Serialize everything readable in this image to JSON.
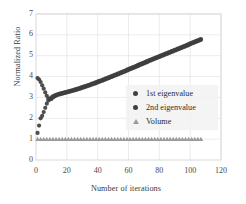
{
  "chart_data": {
    "type": "scatter",
    "title": "",
    "xlabel": "Number of iterations",
    "ylabel": "Normalized Ratio",
    "xlim": [
      0,
      120
    ],
    "ylim": [
      0,
      7
    ],
    "xticks": [
      0,
      20,
      40,
      60,
      80,
      100,
      120
    ],
    "yticks": [
      0,
      1,
      2,
      3,
      4,
      5,
      6,
      7
    ],
    "grid": true,
    "legend_position": "center-right",
    "series": [
      {
        "name": "1st eigenvalue",
        "marker": "circle",
        "color": "#3f3f3f",
        "x": [
          1,
          2,
          3,
          4,
          5,
          6,
          7,
          8,
          9,
          10,
          11,
          12,
          13,
          14,
          15,
          16,
          17,
          18,
          19,
          20,
          21,
          22,
          23,
          24,
          25,
          26,
          27,
          28,
          29,
          30,
          31,
          32,
          33,
          34,
          35,
          36,
          37,
          38,
          39,
          40,
          41,
          42,
          43,
          44,
          45,
          46,
          47,
          48,
          49,
          50,
          51,
          52,
          53,
          54,
          55,
          56,
          57,
          58,
          59,
          60,
          61,
          62,
          63,
          64,
          65,
          66,
          67,
          68,
          69,
          70,
          71,
          72,
          73,
          74,
          75,
          76,
          77,
          78,
          79,
          80,
          81,
          82,
          83,
          84,
          85,
          86,
          87,
          88,
          89,
          90,
          91,
          92,
          93,
          94,
          95,
          96,
          97,
          98,
          99,
          100,
          101,
          102,
          103,
          104,
          105,
          106,
          107
        ],
        "y": [
          3.93,
          3.86,
          3.74,
          3.58,
          3.42,
          3.24,
          3.08,
          2.96,
          2.9,
          2.93,
          3.0,
          3.05,
          3.09,
          3.12,
          3.14,
          3.16,
          3.18,
          3.2,
          3.22,
          3.24,
          3.26,
          3.28,
          3.3,
          3.32,
          3.34,
          3.36,
          3.39,
          3.41,
          3.43,
          3.46,
          3.48,
          3.51,
          3.53,
          3.56,
          3.58,
          3.61,
          3.64,
          3.66,
          3.69,
          3.72,
          3.75,
          3.78,
          3.8,
          3.83,
          3.86,
          3.89,
          3.92,
          3.95,
          3.98,
          4.01,
          4.04,
          4.07,
          4.1,
          4.13,
          4.16,
          4.19,
          4.22,
          4.25,
          4.28,
          4.32,
          4.35,
          4.38,
          4.41,
          4.44,
          4.47,
          4.5,
          4.54,
          4.57,
          4.6,
          4.63,
          4.66,
          4.69,
          4.73,
          4.76,
          4.79,
          4.82,
          4.85,
          4.88,
          4.91,
          4.94,
          4.97,
          5.0,
          5.03,
          5.06,
          5.09,
          5.12,
          5.15,
          5.18,
          5.21,
          5.24,
          5.27,
          5.3,
          5.33,
          5.36,
          5.39,
          5.42,
          5.45,
          5.48,
          5.51,
          5.55,
          5.58,
          5.61,
          5.64,
          5.67,
          5.7,
          5.73,
          5.76
        ]
      },
      {
        "name": "2nd eigenvalue",
        "marker": "circle",
        "color": "#3f3f3f",
        "x": [
          1,
          2,
          3,
          4,
          5,
          6,
          7,
          8,
          9,
          10,
          11,
          12,
          13,
          14,
          15,
          16,
          17,
          18,
          19,
          20,
          21,
          22,
          23,
          24,
          25,
          26,
          27,
          28,
          29,
          30,
          31,
          32,
          33,
          34,
          35,
          36,
          37,
          38,
          39,
          40,
          41,
          42,
          43,
          44,
          45,
          46,
          47,
          48,
          49,
          50,
          51,
          52,
          53,
          54,
          55,
          56,
          57,
          58,
          59,
          60,
          61,
          62,
          63,
          64,
          65,
          66,
          67,
          68,
          69,
          70,
          71,
          72,
          73,
          74,
          75,
          76,
          77,
          78,
          79,
          80,
          81,
          82,
          83,
          84,
          85,
          86,
          87,
          88,
          89,
          90,
          91,
          92,
          93,
          94,
          95,
          96,
          97,
          98,
          99,
          100,
          101,
          102,
          103,
          104,
          105,
          106,
          107
        ],
        "y": [
          1.3,
          1.65,
          2.0,
          2.12,
          2.3,
          2.5,
          2.7,
          2.85,
          2.92,
          3.0,
          3.05,
          3.09,
          3.12,
          3.15,
          3.17,
          3.19,
          3.21,
          3.23,
          3.25,
          3.27,
          3.29,
          3.31,
          3.33,
          3.35,
          3.37,
          3.4,
          3.42,
          3.44,
          3.47,
          3.49,
          3.52,
          3.54,
          3.57,
          3.59,
          3.62,
          3.65,
          3.67,
          3.7,
          3.73,
          3.76,
          3.79,
          3.81,
          3.84,
          3.87,
          3.9,
          3.93,
          3.96,
          3.99,
          4.02,
          4.05,
          4.08,
          4.11,
          4.14,
          4.17,
          4.2,
          4.23,
          4.26,
          4.29,
          4.33,
          4.36,
          4.39,
          4.42,
          4.45,
          4.48,
          4.51,
          4.55,
          4.58,
          4.61,
          4.64,
          4.67,
          4.7,
          4.74,
          4.77,
          4.8,
          4.83,
          4.86,
          4.89,
          4.92,
          4.95,
          4.98,
          5.01,
          5.04,
          5.07,
          5.1,
          5.13,
          5.16,
          5.19,
          5.22,
          5.25,
          5.28,
          5.31,
          5.34,
          5.37,
          5.4,
          5.43,
          5.46,
          5.49,
          5.52,
          5.56,
          5.59,
          5.62,
          5.65,
          5.68,
          5.71,
          5.74,
          5.77,
          5.8
        ]
      },
      {
        "name": "Volume",
        "marker": "triangle",
        "color": "#9a9a9a",
        "x": [
          1,
          3,
          5,
          7,
          9,
          11,
          13,
          15,
          17,
          19,
          21,
          23,
          25,
          27,
          29,
          31,
          33,
          35,
          37,
          39,
          41,
          43,
          45,
          47,
          49,
          51,
          53,
          55,
          57,
          59,
          61,
          63,
          65,
          67,
          69,
          71,
          73,
          75,
          77,
          79,
          81,
          83,
          85,
          87,
          89,
          91,
          93,
          95,
          97,
          99,
          101,
          103,
          105,
          107
        ],
        "y": [
          1,
          1,
          1,
          1,
          1,
          1,
          1,
          1,
          1,
          1,
          1,
          1,
          1,
          1,
          1,
          1,
          1,
          1,
          1,
          1,
          1,
          1,
          1,
          1,
          1,
          1,
          1,
          1,
          1,
          1,
          1,
          1,
          1,
          1,
          1,
          1,
          1,
          1,
          1,
          1,
          1,
          1,
          1,
          1,
          1,
          1,
          1,
          1,
          1,
          1,
          1,
          1,
          1,
          1
        ]
      }
    ]
  },
  "axes": {
    "ylabel": "Normalized Ratio",
    "xlabel": "Number of iterations",
    "yticks": [
      "7",
      "6",
      "5",
      "4",
      "3",
      "2",
      "1",
      "0"
    ],
    "xticks": [
      "0",
      "20",
      "40",
      "60",
      "80",
      "100",
      "120"
    ]
  },
  "legend": {
    "items": [
      {
        "label": "1st eigenvalue",
        "marker": "circle-marker",
        "color": "#3f3f3f"
      },
      {
        "label": "2nd eigenvalue",
        "marker": "circle-marker",
        "color": "#3f3f3f"
      },
      {
        "label": "Volume",
        "marker": "triangle-marker",
        "color": "#9a9a9a"
      }
    ]
  },
  "colors": {
    "grid": "#e4e4e4",
    "border": "#d4d4d4",
    "series1": "#3f3f3f",
    "series2": "#3f3f3f",
    "series3": "#9a9a9a",
    "text": "#3a3a3a"
  }
}
